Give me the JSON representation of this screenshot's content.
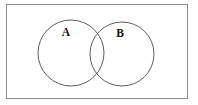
{
  "figure": {
    "type": "venn-diagram",
    "background_color": "#ffffff",
    "frame": {
      "label": "diagram frame",
      "stroke_color": "#8c8c8c",
      "stroke_width": 1,
      "x": 6,
      "y": 4,
      "width": 182,
      "height": 95
    },
    "circles": [
      {
        "id": "A",
        "label": "A",
        "cx": 71,
        "cy": 53,
        "r": 33,
        "stroke_color": "#4a4a4a",
        "stroke_width": 0.9,
        "fill": "none",
        "label_x": 66,
        "label_y": 33
      },
      {
        "id": "B",
        "label": "B",
        "cx": 122,
        "cy": 54,
        "r": 32,
        "stroke_color": "#4a4a4a",
        "stroke_width": 0.9,
        "fill": "none",
        "label_x": 120,
        "label_y": 34
      }
    ]
  }
}
